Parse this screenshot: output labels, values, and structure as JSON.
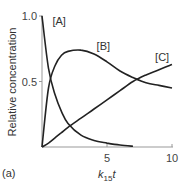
{
  "chart_data": {
    "type": "line",
    "title": "",
    "panel_label": "(a)",
    "xlabel": "k15 t",
    "xlabel_main": "k",
    "xlabel_sub": "15",
    "xlabel_tail": "t",
    "ylabel": "Relative concentration",
    "xlim": [
      0,
      10
    ],
    "ylim": [
      0,
      1.0
    ],
    "x_ticks": [
      {
        "value": 5,
        "label": "5"
      },
      {
        "value": 10,
        "label": "10"
      }
    ],
    "y_ticks": [
      {
        "value": 0.5,
        "label": "0.5"
      },
      {
        "value": 1.0,
        "label": "1.0"
      }
    ],
    "grid": false,
    "legend": "inline labels",
    "x": [
      0,
      0.5,
      1,
      1.5,
      2,
      3,
      4,
      5,
      6,
      7,
      8,
      9,
      10
    ],
    "series": [
      {
        "name": "[A]",
        "values": [
          1.0,
          0.6,
          0.4,
          0.27,
          0.18,
          0.09,
          0.05,
          0.03,
          0.015,
          0.005,
          null,
          null,
          null
        ],
        "label_pos": [
          0.8,
          0.93
        ]
      },
      {
        "name": "[B]",
        "values": [
          0,
          0.45,
          0.62,
          0.7,
          0.73,
          0.74,
          0.71,
          0.65,
          0.58,
          0.53,
          0.49,
          0.47,
          0.45
        ],
        "label_pos": [
          4.2,
          0.74
        ]
      },
      {
        "name": "[C]",
        "values": [
          0,
          0.03,
          0.07,
          0.11,
          0.15,
          0.22,
          0.29,
          0.36,
          0.43,
          0.5,
          0.55,
          0.59,
          0.63
        ],
        "label_pos": [
          8.7,
          0.66
        ]
      }
    ],
    "line_color": "#222222",
    "axis_color": "#999999"
  }
}
